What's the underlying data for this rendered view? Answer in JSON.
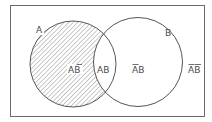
{
  "diagram": {
    "type": "venn",
    "sets": [
      {
        "name": "A",
        "label": "A",
        "shaded": true
      },
      {
        "name": "B",
        "label": "B",
        "shaded": false
      }
    ],
    "regions": [
      {
        "id": "a-not-b",
        "label_first": "A",
        "label_second": "B",
        "first_bar": false,
        "second_bar": true,
        "shaded": true
      },
      {
        "id": "a-and-b",
        "label_first": "A",
        "label_second": "B",
        "first_bar": false,
        "second_bar": false,
        "shaded": false
      },
      {
        "id": "not-a-b",
        "label_first": "A",
        "label_second": "B",
        "first_bar": true,
        "second_bar": false,
        "shaded": false
      },
      {
        "id": "not-a-not-b",
        "label_first": "A",
        "label_second": "B",
        "first_bar": true,
        "second_bar": true,
        "shaded": false
      }
    ],
    "colors": {
      "stroke": "#555555",
      "hatch": "#777777",
      "frame": "#666666",
      "text": "#4a4a4a"
    }
  }
}
